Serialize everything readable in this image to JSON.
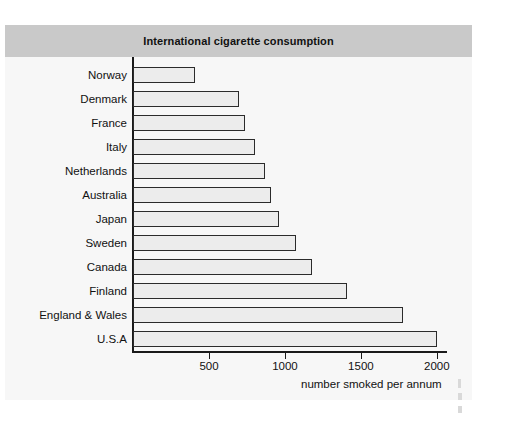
{
  "figure": {
    "title": "International cigarette consumption",
    "background_color": "#f7f7f7",
    "title_bar_color": "#c9c9c9"
  },
  "chart_data": {
    "type": "bar",
    "orientation": "horizontal",
    "title": "International cigarette consumption",
    "xlabel": "number smoked per annum",
    "ylabel": "",
    "categories": [
      "Norway",
      "Denmark",
      "France",
      "Italy",
      "Netherlands",
      "Australia",
      "Japan",
      "Sweden",
      "Canada",
      "Finland",
      "England & Wales",
      "U.S.A"
    ],
    "values": [
      405,
      700,
      740,
      800,
      870,
      905,
      960,
      1070,
      1175,
      1410,
      1780,
      2000
    ],
    "xlim": [
      0,
      2060
    ],
    "xticks": [
      500,
      1000,
      1500,
      2000
    ],
    "xtick_labels": [
      "500",
      "1000",
      "1500",
      "2000"
    ],
    "grid": false,
    "legend": null,
    "bar_fill_color": "#ececec",
    "bar_edge_color": "#2b2b2b"
  }
}
